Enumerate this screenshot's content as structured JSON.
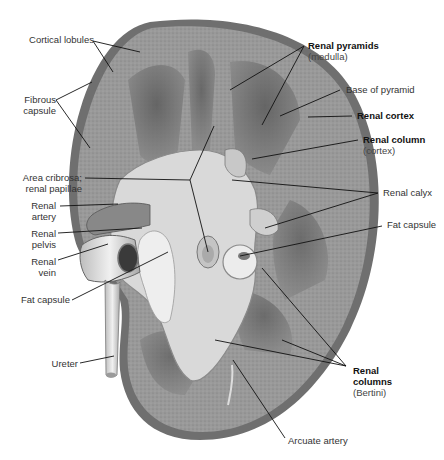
{
  "figure": {
    "colors": {
      "background": "#ffffff",
      "capsule": "#7a7a7a",
      "cortex": "#9a9a9a",
      "pyramid": "#6e6e6e",
      "sinus": "#d8d8d8",
      "fat": "#e6e6e6",
      "leader_line": "#111111",
      "label_text": "#333333"
    }
  },
  "labels": {
    "cortical_lobules": {
      "line1": "Cortical lobules"
    },
    "fibrous_capsule": {
      "line1": "Fibrous",
      "line2": "capsule"
    },
    "area_cribrosa": {
      "line1": "Area cribrosa;",
      "line2": "renal papillae"
    },
    "renal_artery": {
      "line1": "Renal",
      "line2": "artery"
    },
    "renal_pelvis": {
      "line1": "Renal",
      "line2": "pelvis"
    },
    "renal_vein": {
      "line1": "Renal",
      "line2": "vein"
    },
    "fat_capsule_left": {
      "line1": "Fat capsule"
    },
    "ureter": {
      "line1": "Ureter"
    },
    "renal_pyramids": {
      "line1": "Renal pyramids",
      "line2": "(medulla)"
    },
    "base_of_pyramid": {
      "line1": "Base of pyramid"
    },
    "renal_cortex": {
      "line1": "Renal cortex"
    },
    "renal_column": {
      "line1": "Renal column",
      "line2": "(cortex)"
    },
    "renal_calyx": {
      "line1": "Renal calyx"
    },
    "fat_capsule_right": {
      "line1": "Fat capsule"
    },
    "renal_columns": {
      "line1": "Renal",
      "line2": "columns",
      "line3": "(Bertini)"
    },
    "arcuate_artery": {
      "line1": "Arcuate artery"
    }
  }
}
